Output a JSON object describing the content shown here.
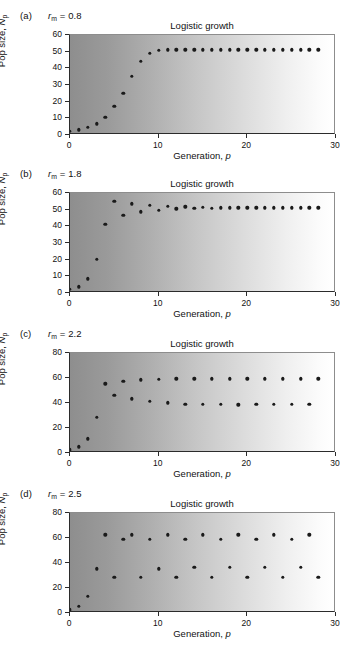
{
  "figure": {
    "shared": {
      "chart_title": "Logistic growth",
      "xlabel_prefix": "Generation, ",
      "xlabel_var": "p",
      "ylabel_prefix": "Pop size, ",
      "ylabel_var": "N",
      "ylabel_sub": "p",
      "rm_var": "r",
      "rm_sub": "m",
      "rm_eq": " = "
    }
  },
  "panels": [
    {
      "letter": "(a)",
      "rm_value": "0.8",
      "chart_data": {
        "type": "scatter",
        "title": "Logistic growth",
        "xlabel": "Generation, p",
        "ylabel": "Pop size, Np",
        "xlim": [
          0,
          30
        ],
        "ylim": [
          0,
          60
        ],
        "xticks": [
          0,
          10,
          20,
          30
        ],
        "yticks": [
          0,
          10,
          20,
          30,
          40,
          50,
          60
        ],
        "grid": false,
        "legend": null,
        "x": [
          0,
          1,
          2,
          3,
          4,
          5,
          6,
          7,
          8,
          9,
          10,
          11,
          12,
          13,
          14,
          15,
          16,
          17,
          18,
          19,
          20,
          21,
          22,
          23,
          24,
          25,
          26,
          27,
          28
        ],
        "values": [
          1,
          2,
          3.5,
          5.5,
          9.5,
          16,
          24,
          34,
          43,
          48,
          49.8,
          50,
          50,
          50,
          50,
          50,
          50,
          50,
          50,
          50,
          50,
          50,
          50,
          50,
          50,
          50,
          50,
          50,
          50
        ]
      }
    },
    {
      "letter": "(b)",
      "rm_value": "1.8",
      "chart_data": {
        "type": "scatter",
        "title": "Logistic growth",
        "xlabel": "Generation, p",
        "ylabel": "Pop size, Np",
        "xlim": [
          0,
          30
        ],
        "ylim": [
          0,
          60
        ],
        "xticks": [
          0,
          10,
          20,
          30
        ],
        "yticks": [
          0,
          10,
          20,
          30,
          40,
          50,
          60
        ],
        "grid": false,
        "legend": null,
        "x": [
          0,
          1,
          2,
          3,
          4,
          5,
          6,
          7,
          8,
          9,
          10,
          11,
          12,
          13,
          14,
          15,
          16,
          17,
          18,
          19,
          20,
          21,
          22,
          23,
          24,
          25,
          26,
          27,
          28
        ],
        "values": [
          1,
          2.7,
          7.5,
          19,
          40,
          54,
          45.5,
          52.5,
          47.5,
          51.5,
          48.5,
          51,
          49.3,
          50.5,
          49.6,
          50.3,
          49.8,
          50.1,
          50,
          50,
          50,
          50,
          50,
          50,
          50,
          50,
          50,
          50,
          50
        ]
      }
    },
    {
      "letter": "(c)",
      "rm_value": "2.2",
      "chart_data": {
        "type": "scatter",
        "title": "Logistic growth",
        "xlabel": "Generation, p",
        "ylabel": "Pop size, Np",
        "xlim": [
          0,
          30
        ],
        "ylim": [
          0,
          80
        ],
        "xticks": [
          0,
          10,
          20,
          30
        ],
        "yticks": [
          0,
          20,
          40,
          60,
          80
        ],
        "grid": false,
        "legend": null,
        "x": [
          0,
          1,
          2,
          3,
          4,
          5,
          6,
          7,
          8,
          9,
          10,
          11,
          12,
          13,
          14,
          15,
          16,
          17,
          18,
          19,
          20,
          21,
          22,
          23,
          24,
          25,
          26,
          27,
          28
        ],
        "values": [
          1,
          3.5,
          10,
          27,
          54,
          44.5,
          56,
          42,
          57,
          40,
          57.5,
          38.5,
          58,
          37.5,
          58,
          37.5,
          58,
          37.5,
          58,
          37,
          58,
          37.5,
          58,
          37.5,
          58,
          37.5,
          58,
          37.5,
          58
        ]
      }
    },
    {
      "letter": "(d)",
      "rm_value": "2.5",
      "chart_data": {
        "type": "scatter",
        "title": "Logistic growth",
        "xlabel": "Generation, p",
        "ylabel": "Pop size, Np",
        "xlim": [
          0,
          30
        ],
        "ylim": [
          0,
          80
        ],
        "xticks": [
          0,
          10,
          20,
          30
        ],
        "yticks": [
          0,
          20,
          40,
          60,
          80
        ],
        "grid": false,
        "legend": null,
        "x": [
          0,
          1,
          2,
          3,
          4,
          5,
          6,
          7,
          8,
          9,
          10,
          11,
          12,
          13,
          14,
          15,
          16,
          17,
          18,
          19,
          20,
          21,
          22,
          23,
          24,
          25,
          26,
          27,
          28
        ],
        "values": [
          1,
          4,
          12,
          34,
          61,
          27,
          57.5,
          61,
          27,
          57.5,
          34,
          61,
          27,
          57.5,
          35,
          61,
          27,
          57.5,
          35,
          61,
          27,
          57.5,
          35,
          61,
          27,
          57.5,
          35,
          61,
          27
        ]
      }
    }
  ]
}
